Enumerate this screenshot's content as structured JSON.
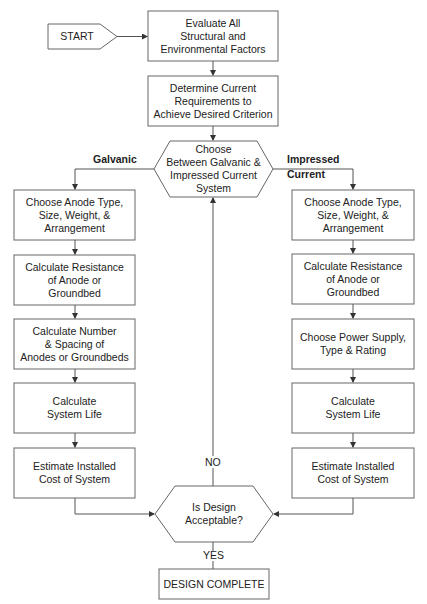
{
  "diagram": {
    "start": "START",
    "evaluate": "Evaluate All\nStructural and\nEnvironmental Factors",
    "determine": "Determine Current\nRequirements to\nAchieve Desired Criterion",
    "choose_system": "Choose\nBetween Galvanic &\nImpressed Current\nSystem",
    "branch_left_label": "Galvanic",
    "branch_right_label": "Impressed\nCurrent",
    "galvanic_steps": [
      "Choose Anode Type,\nSize, Weight, &\nArrangement",
      "Calculate Resistance\nof Anode or\nGroundbed",
      "Calculate Number\n& Spacing of\nAnodes or Groundbeds",
      "Calculate\nSystem Life",
      "Estimate Installed\nCost of System"
    ],
    "impressed_steps": [
      "Choose Anode Type,\nSize, Weight, &\nArrangement",
      "Calculate Resistance\nof Anode or\nGroundbed",
      "Choose Power Supply,\nType & Rating",
      "Calculate\nSystem Life",
      "Estimate Installed\nCost of System"
    ],
    "decision": "Is Design\nAcceptable?",
    "no_label": "NO",
    "yes_label": "YES",
    "complete": "DESIGN COMPLETE"
  },
  "colors": {
    "line": "#555555",
    "text": "#222222",
    "background": "#ffffff"
  }
}
